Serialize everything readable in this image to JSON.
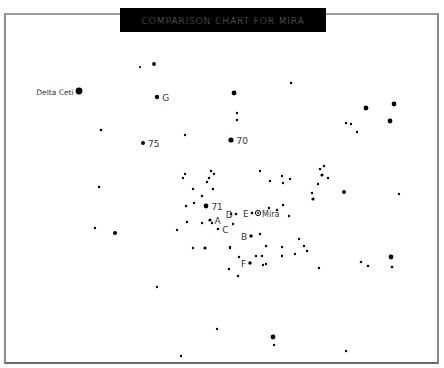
{
  "title": "COMPARISON CHART FOR MIRA",
  "colors": {
    "background": "#ffffff",
    "title_bar": "#000000",
    "title_text": "#7a7a7a",
    "star": "#000000",
    "label": "#333333",
    "frame": "#8a8a8a"
  },
  "target": {
    "name": "Mira",
    "symbol": "circled-dot",
    "x": 258,
    "y": 213
  },
  "labeled_stars": [
    {
      "label": "Delta Ceti",
      "x": 79,
      "y": 91,
      "r": 3.4,
      "label_side": "left"
    },
    {
      "label": "G",
      "x": 157,
      "y": 97,
      "r": 2.2,
      "label_side": "right"
    },
    {
      "label": "75",
      "x": 143,
      "y": 143,
      "r": 2.0,
      "label_side": "right"
    },
    {
      "label": "70",
      "x": 231,
      "y": 140,
      "r": 2.6,
      "label_side": "right"
    },
    {
      "label": "71",
      "x": 206,
      "y": 206,
      "r": 2.4,
      "label_side": "right"
    },
    {
      "label": "A",
      "x": 210,
      "y": 220,
      "r": 1.6,
      "label_side": "right"
    },
    {
      "label": "C",
      "x": 218,
      "y": 229,
      "r": 1.3,
      "label_side": "right"
    },
    {
      "label": "D",
      "x": 236,
      "y": 214,
      "r": 1.3,
      "label_side": "left"
    },
    {
      "label": "E",
      "x": 252,
      "y": 213,
      "r": 1.3,
      "label_side": "left"
    },
    {
      "label": "B",
      "x": 251,
      "y": 236,
      "r": 1.7,
      "label_side": "left"
    },
    {
      "label": "F",
      "x": 250,
      "y": 263,
      "r": 1.7,
      "label_side": "left"
    }
  ],
  "stars": [
    [
      140,
      67,
      1.1
    ],
    [
      154,
      64,
      1.9
    ],
    [
      101,
      130,
      1.3
    ],
    [
      185,
      135,
      1.2
    ],
    [
      234,
      93,
      2.4
    ],
    [
      237,
      113,
      1.2
    ],
    [
      237,
      120,
      1.2
    ],
    [
      291,
      83,
      1.2
    ],
    [
      366,
      108,
      2.4
    ],
    [
      394,
      104,
      2.4
    ],
    [
      390,
      121,
      2.4
    ],
    [
      346,
      123,
      1.2
    ],
    [
      351,
      124,
      1.2
    ],
    [
      357,
      132,
      1.2
    ],
    [
      344,
      192,
      2.0
    ],
    [
      399,
      194,
      1.2
    ],
    [
      99,
      187,
      1.2
    ],
    [
      95,
      228,
      1.2
    ],
    [
      115,
      233,
      2.0
    ],
    [
      185,
      174,
      1.2
    ],
    [
      183,
      178,
      1.2
    ],
    [
      211,
      171,
      1.2
    ],
    [
      214,
      174,
      1.2
    ],
    [
      209,
      178,
      1.2
    ],
    [
      207,
      182,
      1.2
    ],
    [
      193,
      189,
      1.2
    ],
    [
      213,
      189,
      1.2
    ],
    [
      202,
      196,
      1.2
    ],
    [
      186,
      206,
      1.2
    ],
    [
      194,
      203,
      1.2
    ],
    [
      187,
      222,
      1.2
    ],
    [
      202,
      223,
      1.2
    ],
    [
      212,
      223,
      1.2
    ],
    [
      233,
      224,
      1.2
    ],
    [
      231,
      214,
      1.2
    ],
    [
      177,
      230,
      1.2
    ],
    [
      193,
      248,
      1.2
    ],
    [
      205,
      248,
      1.6
    ],
    [
      230,
      248,
      1.2
    ],
    [
      260,
      234,
      1.2
    ],
    [
      266,
      246,
      1.2
    ],
    [
      230,
      247,
      1.2
    ],
    [
      239,
      257,
      1.2
    ],
    [
      256,
      256,
      1.2
    ],
    [
      262,
      256,
      1.2
    ],
    [
      263,
      265,
      1.2
    ],
    [
      266,
      264,
      1.2
    ],
    [
      229,
      269,
      1.2
    ],
    [
      238,
      276,
      1.2
    ],
    [
      282,
      247,
      1.2
    ],
    [
      282,
      256,
      1.2
    ],
    [
      295,
      254,
      1.2
    ],
    [
      299,
      239,
      1.2
    ],
    [
      304,
      246,
      1.2
    ],
    [
      307,
      251,
      1.2
    ],
    [
      319,
      268,
      1.2
    ],
    [
      260,
      171,
      1.2
    ],
    [
      270,
      181,
      1.2
    ],
    [
      282,
      176,
      1.2
    ],
    [
      290,
      179,
      1.2
    ],
    [
      269,
      208,
      1.2
    ],
    [
      277,
      210,
      1.2
    ],
    [
      283,
      205,
      1.2
    ],
    [
      289,
      216,
      1.2
    ],
    [
      283,
      183,
      1.2
    ],
    [
      320,
      169,
      1.2
    ],
    [
      324,
      166,
      1.2
    ],
    [
      322,
      175,
      1.6
    ],
    [
      328,
      178,
      1.2
    ],
    [
      318,
      184,
      1.2
    ],
    [
      312,
      193,
      1.2
    ],
    [
      313,
      199,
      1.6
    ],
    [
      361,
      262,
      1.3
    ],
    [
      368,
      266,
      1.3
    ],
    [
      391,
      257,
      2.4
    ],
    [
      392,
      267,
      1.3
    ],
    [
      157,
      287,
      1.2
    ],
    [
      217,
      329,
      1.2
    ],
    [
      181,
      356,
      1.2
    ],
    [
      273,
      337,
      2.4
    ],
    [
      274,
      345,
      1.2
    ],
    [
      346,
      351,
      1.2
    ]
  ]
}
